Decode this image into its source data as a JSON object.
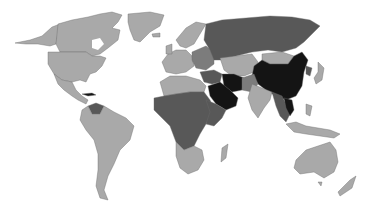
{
  "map": {
    "type": "choropleth",
    "projection": "world",
    "background": "#ffffff",
    "legend": null,
    "title": null,
    "shades": {
      "light": "#a9a9a9",
      "mid": "#7c7c7c",
      "dark": "#585858",
      "darkest": "#141414"
    },
    "regions": [
      {
        "id": "alaska",
        "shade": "light"
      },
      {
        "id": "canada",
        "shade": "light"
      },
      {
        "id": "usa",
        "shade": "light"
      },
      {
        "id": "mexico-central-america",
        "shade": "light"
      },
      {
        "id": "greenland",
        "shade": "light"
      },
      {
        "id": "cuba",
        "shade": "darkest"
      },
      {
        "id": "venezuela",
        "shade": "dark"
      },
      {
        "id": "south-america",
        "shade": "light"
      },
      {
        "id": "western-europe",
        "shade": "light"
      },
      {
        "id": "scandinavia",
        "shade": "light"
      },
      {
        "id": "eastern-europe",
        "shade": "mid"
      },
      {
        "id": "russia",
        "shade": "dark"
      },
      {
        "id": "kazakhstan-central-asia",
        "shade": "light"
      },
      {
        "id": "mongolia",
        "shade": "light"
      },
      {
        "id": "china",
        "shade": "darkest"
      },
      {
        "id": "iran",
        "shade": "darkest"
      },
      {
        "id": "saudi-arabia",
        "shade": "darkest"
      },
      {
        "id": "middle-east-other",
        "shade": "dark"
      },
      {
        "id": "north-africa",
        "shade": "light"
      },
      {
        "id": "central-africa",
        "shade": "dark"
      },
      {
        "id": "east-africa",
        "shade": "dark"
      },
      {
        "id": "southern-africa",
        "shade": "light"
      },
      {
        "id": "madagascar",
        "shade": "light"
      },
      {
        "id": "india",
        "shade": "light"
      },
      {
        "id": "southeast-asia",
        "shade": "dark"
      },
      {
        "id": "vietnam-laos",
        "shade": "darkest"
      },
      {
        "id": "indonesia",
        "shade": "light"
      },
      {
        "id": "japan",
        "shade": "light"
      },
      {
        "id": "korea",
        "shade": "dark"
      },
      {
        "id": "australia",
        "shade": "light"
      },
      {
        "id": "new-zealand",
        "shade": "light"
      }
    ]
  }
}
